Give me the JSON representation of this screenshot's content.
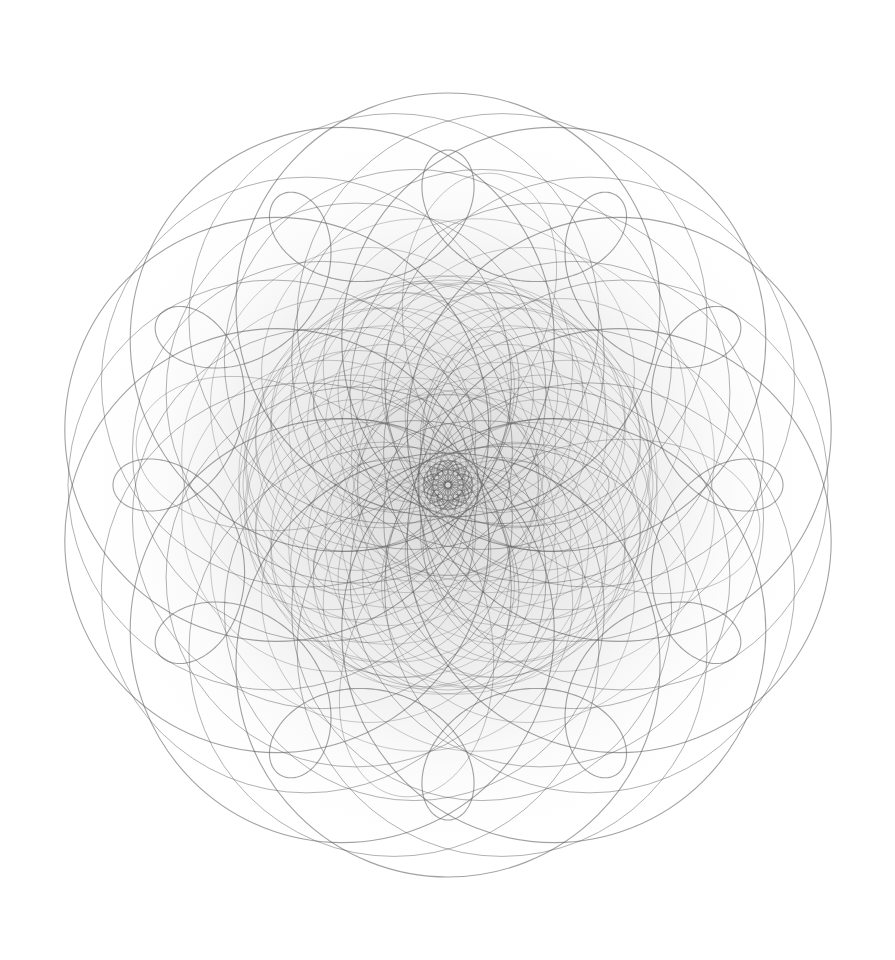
{
  "artwork": {
    "title": "",
    "description": "Monochrome spirograph / rosette line drawing of overlapping circles and looping curves with radial symmetry",
    "background": "#ffffff",
    "stroke_color": "#555555",
    "center": [
      448,
      485
    ],
    "outer_radius": 392,
    "families": [
      {
        "name": "outer-circle-ring",
        "type": "circle-ring",
        "count": 10,
        "ring_radius": 180,
        "circle_radius": 212,
        "rotation": 0,
        "opacity": 0.55,
        "width": 1.1
      },
      {
        "name": "outer-circle-ring-2",
        "type": "circle-ring",
        "count": 10,
        "ring_radius": 175,
        "circle_radius": 205,
        "rotation": 18,
        "opacity": 0.45,
        "width": 1.0
      },
      {
        "name": "mid-circle-ring",
        "type": "circle-ring",
        "count": 12,
        "ring_radius": 130,
        "circle_radius": 190,
        "rotation": 15,
        "opacity": 0.45,
        "width": 1.0
      },
      {
        "name": "petal-loops",
        "type": "hypotrochoid",
        "R": 300,
        "r": 25,
        "d": 60,
        "scale": 1.0,
        "rotation": 0,
        "opacity": 0.55,
        "width": 1.1
      },
      {
        "name": "loop-rosette-a",
        "type": "epitrochoid",
        "R": 120,
        "r": 10,
        "d": 140,
        "scale": 1.0,
        "rotation": 0,
        "opacity": 0.35,
        "width": 0.9
      },
      {
        "name": "loop-rosette-b",
        "type": "hypotrochoid",
        "R": 220,
        "r": 55,
        "d": 150,
        "scale": 1.0,
        "rotation": 9,
        "opacity": 0.4,
        "width": 0.9
      },
      {
        "name": "inner-circle-ring",
        "type": "circle-ring",
        "count": 24,
        "ring_radius": 95,
        "circle_radius": 110,
        "rotation": 0,
        "opacity": 0.35,
        "width": 0.9
      },
      {
        "name": "inner-circle-ring-2",
        "type": "circle-ring",
        "count": 20,
        "ring_radius": 60,
        "circle_radius": 150,
        "rotation": 9,
        "opacity": 0.3,
        "width": 0.9
      },
      {
        "name": "core-dense",
        "type": "hypotrochoid",
        "R": 110,
        "r": 44,
        "d": 95,
        "scale": 1.0,
        "rotation": 0,
        "opacity": 0.45,
        "width": 0.9
      },
      {
        "name": "core-rosette",
        "type": "circle-ring",
        "count": 16,
        "ring_radius": 14,
        "circle_radius": 11,
        "rotation": 0,
        "opacity": 0.6,
        "width": 0.9
      }
    ]
  }
}
